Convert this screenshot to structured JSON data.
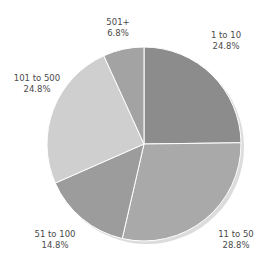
{
  "chart_data": {
    "type": "pie",
    "title": "",
    "categories": [
      "1 to 10",
      "11 to 50",
      "51 to 100",
      "101 to 500",
      "501+"
    ],
    "values": [
      24.8,
      28.8,
      14.8,
      24.8,
      6.8
    ],
    "value_labels": [
      "24.8%",
      "28.8%",
      "14.8%",
      "24.8%",
      "6.8%"
    ],
    "colors": [
      "#8c8c8c",
      "#a9a9a9",
      "#9c9c9c",
      "#cfcfcf",
      "#a3a3a3"
    ],
    "start_angle_deg": 0,
    "direction": "clockwise",
    "legend": "none",
    "data_labels": "outside"
  },
  "labels": [
    {
      "name": "1 to 10",
      "pct": "24.8%"
    },
    {
      "name": "11 to 50",
      "pct": "28.8%"
    },
    {
      "name": "51 to 100",
      "pct": "14.8%"
    },
    {
      "name": "101 to 500",
      "pct": "24.8%"
    },
    {
      "name": "501+",
      "pct": "6.8%"
    }
  ]
}
